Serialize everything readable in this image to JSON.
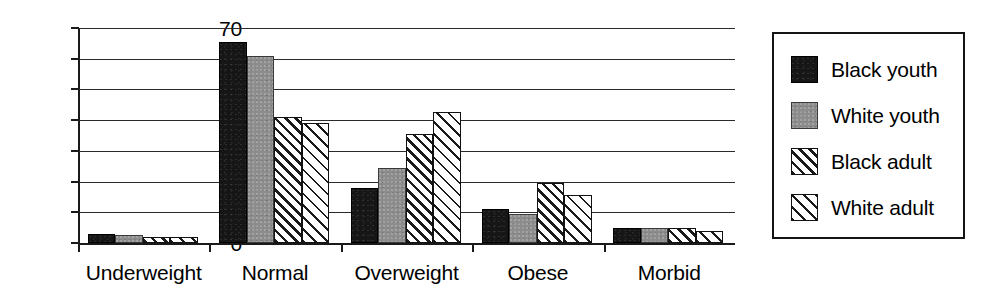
{
  "chart_data": {
    "type": "bar",
    "title": "",
    "subtitle": "",
    "xlabel": "",
    "ylabel": "",
    "ylim": [
      0,
      70
    ],
    "yticks": [
      0,
      10,
      20,
      30,
      40,
      50,
      60,
      70
    ],
    "ytick_labels": [
      "0",
      "10",
      "20",
      "30",
      "40",
      "50",
      "60",
      "70"
    ],
    "grid": true,
    "grid_axis": "y",
    "legend_position": "right-outside",
    "categories": [
      "Underweight",
      "Normal",
      "Overweight",
      "Obese",
      "Morbid"
    ],
    "series": [
      {
        "name": "Black youth",
        "pattern": "solid-black",
        "color": "#161616",
        "values": [
          3,
          65.5,
          18,
          11,
          5
        ]
      },
      {
        "name": "White youth",
        "pattern": "solid-gray",
        "color": "#8c8c8c",
        "values": [
          2.5,
          61,
          24.5,
          9.5,
          5
        ]
      },
      {
        "name": "Black adult",
        "pattern": "dense-diagonal-hatch",
        "color": "#ffffff",
        "values": [
          2,
          41,
          35.5,
          19.5,
          5
        ]
      },
      {
        "name": "White adult",
        "pattern": "sparse-diagonal-hatch",
        "color": "#ffffff",
        "values": [
          2,
          39,
          42.5,
          15.5,
          4
        ]
      }
    ]
  },
  "legend": {
    "items": [
      {
        "label": "Black youth"
      },
      {
        "label": "White youth"
      },
      {
        "label": "Black adult"
      },
      {
        "label": "White adult"
      }
    ]
  },
  "colors": {
    "axis": "#1a1a1a",
    "grid": "#2b2b2b",
    "background": "#ffffff",
    "legend_border": "#141414"
  }
}
